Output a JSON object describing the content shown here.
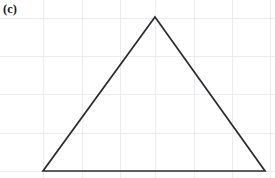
{
  "figure": {
    "panel_label": "(c)",
    "width": 275,
    "height": 178,
    "background_color": "#ffffff"
  },
  "chart_data": {
    "type": "line",
    "title": "(c)",
    "subtitle": "",
    "xlabel": "",
    "ylabel": "",
    "grid": true,
    "legend_position": "none",
    "tick_labels": {
      "x": [],
      "y": []
    },
    "xlim": [
      0,
      275
    ],
    "ylim": [
      178,
      0
    ],
    "annotations": [
      {
        "text": "(c)",
        "x": 4,
        "y": 10,
        "role": "panel-label"
      }
    ],
    "grid_lines": {
      "color": "#eceaf2",
      "width": 1,
      "vertical_x": [
        43,
        82,
        120,
        155,
        194,
        232,
        270
      ],
      "horizontal_y": [
        18,
        56,
        94,
        133,
        171
      ]
    },
    "series": [
      {
        "name": "triangle-outline",
        "type": "closed-polygon",
        "color": "#2b2b2b",
        "line_width": 1.7,
        "fill": "none",
        "points": [
          {
            "name": "apex",
            "x": 155,
            "y": 17
          },
          {
            "name": "bottom-right",
            "x": 265,
            "y": 171
          },
          {
            "name": "bottom-left",
            "x": 43,
            "y": 171
          }
        ]
      }
    ]
  }
}
